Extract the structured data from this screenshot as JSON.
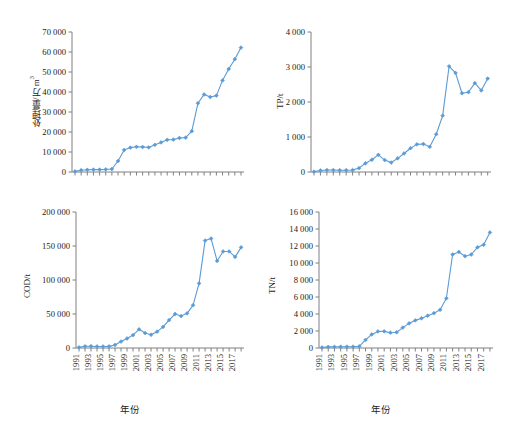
{
  "figure": {
    "background_color": "#ffffff",
    "series_color": "#5B9BD5",
    "axis_color": "#808080",
    "panel_count": 4
  },
  "common": {
    "xlabel": "年份",
    "years": [
      1991,
      1992,
      1993,
      1994,
      1995,
      1996,
      1997,
      1998,
      1999,
      2000,
      2001,
      2002,
      2003,
      2004,
      2005,
      2006,
      2007,
      2008,
      2009,
      2010,
      2011,
      2012,
      2013,
      2014,
      2015,
      2016,
      2017,
      2018
    ],
    "xtick_labels": [
      "1991",
      "1993",
      "1995",
      "1997",
      "1999",
      "2001",
      "2003",
      "2005",
      "2007",
      "2009",
      "2011",
      "2013",
      "2015",
      "2017"
    ]
  },
  "chart_data": [
    {
      "type": "line",
      "panel": "top-left",
      "title": "",
      "ylabel": "处理量/万 m³",
      "xlabel": "",
      "ylim": [
        0,
        70000
      ],
      "yticks": [
        0,
        10000,
        20000,
        30000,
        40000,
        50000,
        60000,
        70000
      ],
      "ytick_labels": [
        "0",
        "10 000",
        "20 000",
        "30 000",
        "40 000",
        "50 000",
        "60 000",
        "70 000"
      ],
      "grid": false,
      "legend": "none",
      "marker": "diamond",
      "categories": [
        1991,
        1992,
        1993,
        1994,
        1995,
        1996,
        1997,
        1998,
        1999,
        2000,
        2001,
        2002,
        2003,
        2004,
        2005,
        2006,
        2007,
        2008,
        2009,
        2010,
        2011,
        2012,
        2013,
        2014,
        2015,
        2016,
        2017,
        2018
      ],
      "values": [
        300,
        900,
        1100,
        1200,
        1200,
        1300,
        1500,
        5500,
        11000,
        12200,
        12600,
        12500,
        12300,
        13600,
        14800,
        16100,
        16200,
        17000,
        17200,
        20400,
        34400,
        38800,
        37500,
        38200,
        45800,
        51500,
        56400,
        62200
      ]
    },
    {
      "type": "line",
      "panel": "top-right",
      "title": "",
      "ylabel": "TP/t",
      "xlabel": "",
      "ylim": [
        0,
        4000
      ],
      "yticks": [
        0,
        1000,
        2000,
        3000,
        4000
      ],
      "ytick_labels": [
        "0",
        "1 000",
        "2 000",
        "3 000",
        "4 000"
      ],
      "grid": false,
      "legend": "none",
      "marker": "diamond",
      "categories": [
        1991,
        1992,
        1993,
        1994,
        1995,
        1996,
        1997,
        1998,
        1999,
        2000,
        2001,
        2002,
        2003,
        2004,
        2005,
        2006,
        2007,
        2008,
        2009,
        2010,
        2011,
        2012,
        2013,
        2014,
        2015,
        2016,
        2017,
        2018
      ],
      "values": [
        10,
        45,
        55,
        55,
        50,
        50,
        55,
        110,
        250,
        350,
        490,
        340,
        270,
        390,
        530,
        680,
        790,
        800,
        720,
        1080,
        1610,
        3020,
        2830,
        2250,
        2280,
        2540,
        2330,
        2670
      ],
      "last_value_note": 3060
    },
    {
      "type": "line",
      "panel": "bottom-left",
      "title": "",
      "ylabel": "COD/t",
      "xlabel": "年份",
      "ylim": [
        0,
        200000
      ],
      "yticks": [
        0,
        50000,
        100000,
        150000,
        200000
      ],
      "ytick_labels": [
        "0",
        "50 000",
        "100 000",
        "150 000",
        "200 000"
      ],
      "grid": false,
      "legend": "none",
      "marker": "diamond",
      "categories": [
        1991,
        1992,
        1993,
        1994,
        1995,
        1996,
        1997,
        1998,
        1999,
        2000,
        2001,
        2002,
        2003,
        2004,
        2005,
        2006,
        2007,
        2008,
        2009,
        2010,
        2011,
        2012,
        2013,
        2014,
        2015,
        2016,
        2017,
        2018
      ],
      "values": [
        1000,
        2500,
        2600,
        2300,
        2200,
        2400,
        4500,
        9500,
        14000,
        19000,
        27500,
        22000,
        19500,
        24000,
        31000,
        41000,
        50000,
        47000,
        51000,
        63000,
        95000,
        158000,
        161000,
        128000,
        142000,
        142000,
        134000,
        148000
      ]
    },
    {
      "type": "line",
      "panel": "bottom-right",
      "title": "",
      "ylabel": "TN/t",
      "xlabel": "年份",
      "ylim": [
        0,
        16000
      ],
      "yticks": [
        0,
        2000,
        4000,
        6000,
        8000,
        10000,
        12000,
        14000,
        16000
      ],
      "ytick_labels": [
        "0",
        "2 000",
        "4 000",
        "6 000",
        "8 000",
        "10 000",
        "12 000",
        "14 000",
        "16 000"
      ],
      "grid": false,
      "legend": "none",
      "marker": "diamond",
      "categories": [
        1991,
        1992,
        1993,
        1994,
        1995,
        1996,
        1997,
        1998,
        1999,
        2000,
        2001,
        2002,
        2003,
        2004,
        2005,
        2006,
        2007,
        2008,
        2009,
        2010,
        2011,
        2012,
        2013,
        2014,
        2015,
        2016,
        2017,
        2018
      ],
      "values": [
        60,
        130,
        140,
        150,
        150,
        160,
        200,
        950,
        1600,
        1950,
        1960,
        1800,
        1850,
        2400,
        2900,
        3250,
        3500,
        3800,
        4100,
        4500,
        5850,
        11000,
        11300,
        10800,
        11000,
        11850,
        12150,
        13600
      ]
    }
  ]
}
